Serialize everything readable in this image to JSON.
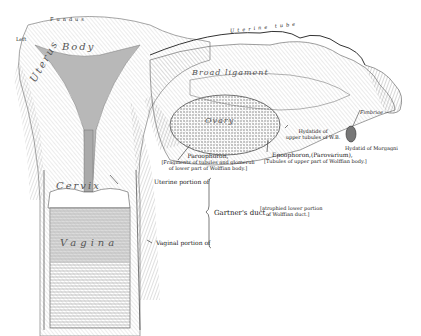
{
  "figure": {
    "structure_labels": {
      "fundus": "Fundus",
      "left": "Left",
      "body": "Body",
      "uterus": "Uterus",
      "cervix": "Cervix",
      "vagina": "Vagina",
      "uterine_tube": "Uterine tube",
      "broad_ligament": "Broad ligament",
      "ovary": "Ovary",
      "fimbriae": "Fimbriae"
    },
    "annotations": {
      "paroophoron_title": "Paroophoron,",
      "paroophoron_desc_1": "[Fragments of tubules and glomeruli",
      "paroophoron_desc_2": "of lower part of Wolffian body.]",
      "hydatids_1": "Hydatids of",
      "hydatids_2": "upper tubules of W.B.",
      "epoophoron_title": "Epoophoron,(Parovarium),",
      "epoophoron_desc": "[Tubules of upper part of Wolffian body.]",
      "hydatid_morgagni": "Hydatid of Morgagni",
      "uterine_portion": "Uterine portion of",
      "gartners_duct": "Gartner's duct ,",
      "gartners_desc_1": "[atrophied lower portion",
      "gartners_desc_2": "of Wolffian duct.]",
      "vaginal_portion": "Vaginal portion of"
    },
    "colors": {
      "ink": "#222222",
      "shade": "#9a9a9a",
      "cavity": "#b8b8b8",
      "background": "#ffffff"
    }
  }
}
